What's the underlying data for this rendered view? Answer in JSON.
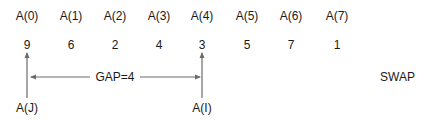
{
  "array": {
    "headers": [
      "A(0)",
      "A(1)",
      "A(2)",
      "A(3)",
      "A(4)",
      "A(5)",
      "A(6)",
      "A(7)"
    ],
    "values": [
      "9",
      "6",
      "2",
      "4",
      "3",
      "5",
      "7",
      "1"
    ]
  },
  "pointers": {
    "j_label": "A(J)",
    "i_label": "A(I)",
    "j_index": 0,
    "i_index": 4
  },
  "gap": {
    "label": "GAP=4"
  },
  "action": {
    "label": "SWAP"
  },
  "colors": {
    "text": "#1a1a1a",
    "arrow": "#6b6b6b"
  }
}
